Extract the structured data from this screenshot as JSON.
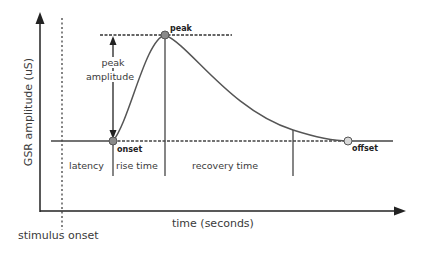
{
  "diagram": {
    "y_axis_label": "GSR amplitude (uS)",
    "x_axis_label": "time (seconds)",
    "stimulus_label": "stimulus onset",
    "points": {
      "peak": "peak",
      "onset": "onset",
      "offset": "offset"
    },
    "annotations": {
      "peak_amplitude_line1": "peak",
      "peak_amplitude_line2": "amplitude"
    },
    "intervals": [
      {
        "label": "latency"
      },
      {
        "label": "rise time"
      },
      {
        "label": "recovery time"
      }
    ],
    "colors": {
      "line": "#333333",
      "curve": "#555555",
      "point_fill": "#8a8a8a",
      "offset_fill": "#cccccc"
    }
  }
}
